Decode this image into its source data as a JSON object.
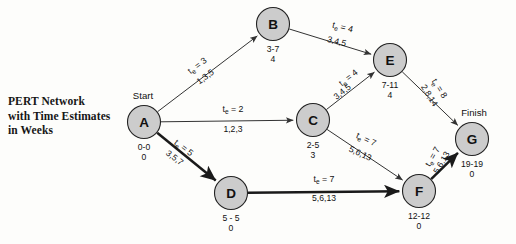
{
  "caption": {
    "line1": "PERT Network",
    "line2": "with Time Estimates",
    "line3": "in Weeks"
  },
  "colors": {
    "node_fill": "#cccccc",
    "node_stroke": "#222222",
    "edge": "#333333",
    "critical_edge": "#1a1a1a",
    "text": "#111111",
    "background": "#fdfdfb"
  },
  "endpoint_labels": {
    "start": "Start",
    "finish": "Finish"
  },
  "chart_data": {
    "type": "diagram",
    "title": "PERT Network with Time Estimates in Weeks",
    "nodes": [
      {
        "id": "A",
        "label": "A",
        "times": "0-0",
        "slack": "0",
        "cx": 144,
        "cy": 122,
        "r": 16.5,
        "endpoint": "Start"
      },
      {
        "id": "B",
        "label": "B",
        "times": "3-7",
        "slack": "4",
        "cx": 273,
        "cy": 24,
        "r": 16.5,
        "endpoint": ""
      },
      {
        "id": "C",
        "label": "C",
        "times": "2-5",
        "slack": "3",
        "cx": 313,
        "cy": 120,
        "r": 16.5,
        "endpoint": ""
      },
      {
        "id": "D",
        "label": "D",
        "times": "5 - 5",
        "slack": "0",
        "cx": 231,
        "cy": 193,
        "r": 16.5,
        "endpoint": ""
      },
      {
        "id": "E",
        "label": "E",
        "times": "7-11",
        "slack": "4",
        "cx": 390,
        "cy": 60,
        "r": 16.5,
        "endpoint": ""
      },
      {
        "id": "F",
        "label": "F",
        "times": "12-12",
        "slack": "0",
        "cx": 419,
        "cy": 191,
        "r": 16.5,
        "endpoint": ""
      },
      {
        "id": "G",
        "label": "G",
        "times": "19-19",
        "slack": "0",
        "cx": 472,
        "cy": 139,
        "r": 16.5,
        "endpoint": "Finish"
      }
    ],
    "edges": [
      {
        "from": "A",
        "to": "B",
        "te": "t",
        "te_sub": "e",
        "te_val": "= 3",
        "te_label": "tₑ = 3",
        "estimates": "1,3,5",
        "critical": false,
        "te_x": 199,
        "te_y": 68,
        "est_x": 207,
        "est_y": 79,
        "rot": -37
      },
      {
        "from": "A",
        "to": "C",
        "te_label": "tₑ = 2",
        "estimates": "1,2,3",
        "critical": false,
        "te_x": 233,
        "te_y": 112,
        "est_x": 233,
        "est_y": 132,
        "rot": 0
      },
      {
        "from": "A",
        "to": "D",
        "te_label": "tₑ = 5",
        "estimates": "3,5,7",
        "critical": true,
        "te_x": 182,
        "te_y": 150,
        "est_x": 173,
        "est_y": 160,
        "rot": 37
      },
      {
        "from": "B",
        "to": "E",
        "te_label": "tₑ = 4",
        "estimates": "3,4,5",
        "critical": false,
        "te_x": 342,
        "te_y": 30,
        "est_x": 336,
        "est_y": 44,
        "rot": 14
      },
      {
        "from": "C",
        "to": "E",
        "te_label": "tₑ = 4",
        "estimates": "3,4,5",
        "critical": false,
        "te_x": 350,
        "te_y": 80,
        "est_x": 344,
        "est_y": 94,
        "rot": -38
      },
      {
        "from": "C",
        "to": "F",
        "te_label": "tₑ = 7",
        "estimates": "5,6,13",
        "critical": false,
        "te_x": 365,
        "te_y": 142,
        "est_x": 359,
        "est_y": 156,
        "rot": 25
      },
      {
        "from": "D",
        "to": "F",
        "te_label": "tₑ = 7",
        "estimates": "5,6,13",
        "critical": true,
        "te_x": 324,
        "te_y": 182,
        "est_x": 324,
        "est_y": 201,
        "rot": 0
      },
      {
        "from": "E",
        "to": "G",
        "te_label": "tₑ = 8",
        "estimates": "2,8,14",
        "critical": false,
        "te_x": 437,
        "te_y": 90,
        "est_x": 427,
        "est_y": 97,
        "rot": 58
      },
      {
        "from": "F",
        "to": "G",
        "te_label": "tₑ = 7",
        "estimates": "5,6,13",
        "critical": true,
        "te_x": 435,
        "te_y": 158,
        "est_x": 444,
        "est_y": 164,
        "rot": -60
      }
    ]
  }
}
